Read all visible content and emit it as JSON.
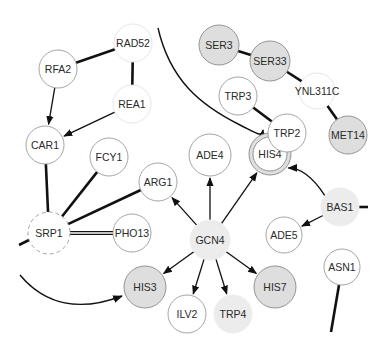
{
  "diagram": {
    "type": "gene-interaction-network",
    "nodes": [
      {
        "id": "RAD52",
        "label": "RAD52",
        "x": 133,
        "y": 43,
        "r": 19,
        "style": "faint"
      },
      {
        "id": "RFA2",
        "label": "RFA2",
        "x": 58,
        "y": 69,
        "r": 19,
        "style": "white"
      },
      {
        "id": "REA1",
        "label": "REA1",
        "x": 132,
        "y": 104,
        "r": 19,
        "style": "faint"
      },
      {
        "id": "CAR1",
        "label": "CAR1",
        "x": 45,
        "y": 145,
        "r": 19,
        "style": "white"
      },
      {
        "id": "FCY1",
        "label": "FCY1",
        "x": 109,
        "y": 157,
        "r": 19,
        "style": "white"
      },
      {
        "id": "ARG1",
        "label": "ARG1",
        "x": 158,
        "y": 182,
        "r": 19,
        "style": "white"
      },
      {
        "id": "ADE4",
        "label": "ADE4",
        "x": 210,
        "y": 155,
        "r": 21,
        "style": "white"
      },
      {
        "id": "SRP1",
        "label": "SRP1",
        "x": 49,
        "y": 233,
        "r": 21,
        "style": "dashed"
      },
      {
        "id": "PHO13",
        "label": "PHO13",
        "x": 132,
        "y": 233,
        "r": 19,
        "style": "white"
      },
      {
        "id": "GCN4",
        "label": "GCN4",
        "x": 210,
        "y": 240,
        "r": 20,
        "style": "lightgray"
      },
      {
        "id": "HIS3",
        "label": "HIS3",
        "x": 145,
        "y": 287,
        "r": 21,
        "style": "gray"
      },
      {
        "id": "ILV2",
        "label": "ILV2",
        "x": 187,
        "y": 314,
        "r": 19,
        "style": "white"
      },
      {
        "id": "TRP4",
        "label": "TRP4",
        "x": 233,
        "y": 314,
        "r": 19,
        "style": "lightgray"
      },
      {
        "id": "HIS7",
        "label": "HIS7",
        "x": 275,
        "y": 287,
        "r": 21,
        "style": "gray"
      },
      {
        "id": "HIS4",
        "label": "HIS4",
        "x": 270,
        "y": 154,
        "r": 21,
        "style": "double"
      },
      {
        "id": "BAS1",
        "label": "BAS1",
        "x": 340,
        "y": 207,
        "r": 19,
        "style": "lightgray"
      },
      {
        "id": "ADE5",
        "label": "ADE5",
        "x": 284,
        "y": 235,
        "r": 18,
        "style": "white"
      },
      {
        "id": "ASN1",
        "label": "ASN1",
        "x": 342,
        "y": 267,
        "r": 18,
        "style": "white"
      },
      {
        "id": "SER3",
        "label": "SER3",
        "x": 219,
        "y": 45,
        "r": 20,
        "style": "gray"
      },
      {
        "id": "SER33",
        "label": "SER33",
        "x": 270,
        "y": 61,
        "r": 20,
        "style": "gray"
      },
      {
        "id": "YNL311C",
        "label": "YNL311C",
        "x": 317,
        "y": 91,
        "r": 18,
        "style": "faint"
      },
      {
        "id": "TRP3",
        "label": "TRP3",
        "x": 238,
        "y": 96,
        "r": 19,
        "style": "white"
      },
      {
        "id": "TRP2",
        "label": "TRP2",
        "x": 287,
        "y": 133,
        "r": 19,
        "style": "white"
      },
      {
        "id": "MET14",
        "label": "MET14",
        "x": 348,
        "y": 135,
        "r": 19,
        "style": "gray"
      }
    ],
    "edges": [
      {
        "from": "RAD52",
        "to": "RFA2",
        "kind": "undirected-thick"
      },
      {
        "from": "RAD52",
        "to": "REA1",
        "kind": "undirected-thick"
      },
      {
        "from": "RFA2",
        "to": "CAR1",
        "kind": "directed"
      },
      {
        "from": "REA1",
        "to": "CAR1",
        "kind": "directed"
      },
      {
        "from": "CAR1",
        "to": "SRP1",
        "kind": "undirected-thick"
      },
      {
        "from": "FCY1",
        "to": "SRP1",
        "kind": "undirected-thick"
      },
      {
        "from": "ARG1",
        "to": "SRP1",
        "kind": "undirected-thick"
      },
      {
        "from": "PHO13",
        "to": "SRP1",
        "kind": "undirected-double"
      },
      {
        "from": "GCN4",
        "to": "ARG1",
        "kind": "directed"
      },
      {
        "from": "GCN4",
        "to": "ADE4",
        "kind": "directed"
      },
      {
        "from": "GCN4",
        "to": "HIS4",
        "kind": "directed"
      },
      {
        "from": "GCN4",
        "to": "HIS3",
        "kind": "directed"
      },
      {
        "from": "GCN4",
        "to": "ILV2",
        "kind": "directed"
      },
      {
        "from": "GCN4",
        "to": "TRP4",
        "kind": "directed"
      },
      {
        "from": "GCN4",
        "to": "HIS7",
        "kind": "directed"
      },
      {
        "from": "BAS1",
        "to": "HIS4",
        "kind": "directed-curve"
      },
      {
        "from": "BAS1",
        "to": "ADE5",
        "kind": "directed"
      },
      {
        "from": "SER3",
        "to": "SER33",
        "kind": "undirected-thick"
      },
      {
        "from": "SER33",
        "to": "YNL311C",
        "kind": "undirected-thick"
      },
      {
        "from": "YNL311C",
        "to": "MET14",
        "kind": "undirected-thick"
      },
      {
        "from": "TRP3",
        "to": "TRP2",
        "kind": "undirected-thick"
      }
    ],
    "offscreen_edges": [
      {
        "from_node": "SRP1",
        "direction": "left",
        "kind": "thick-stub"
      },
      {
        "from_node": "BAS1",
        "direction": "right",
        "kind": "thick-stub"
      },
      {
        "from_node": "ASN1",
        "direction": "down",
        "kind": "thick"
      },
      {
        "to_node": "HIS3",
        "direction": "from-left-curve",
        "kind": "directed-curve"
      },
      {
        "to_node": "HIS4",
        "direction": "from-top-curve",
        "kind": "directed-curve"
      }
    ],
    "colors": {
      "gray_fill": "#dedede",
      "light_fill": "#ececec",
      "white_fill": "#ffffff",
      "edge": "#111111"
    }
  }
}
